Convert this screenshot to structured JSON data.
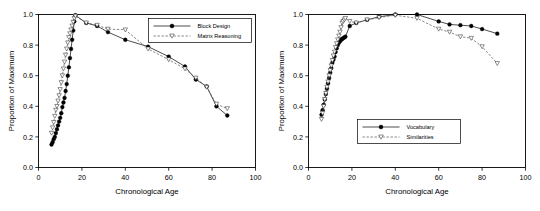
{
  "figure": {
    "background": "#ffffff",
    "line_color": "#000000",
    "dash_color": "#555555"
  },
  "chart_data": [
    {
      "type": "scatter",
      "panel": "left",
      "title": "",
      "xlabel": "Chronological Age",
      "ylabel": "Proportion of Maximum",
      "xlim": [
        0,
        100
      ],
      "ylim": [
        0.0,
        1.0
      ],
      "xticks": [
        0,
        20,
        40,
        60,
        80,
        100
      ],
      "yticks": [
        0.0,
        0.2,
        0.4,
        0.6,
        0.8,
        1.0
      ],
      "xticklabels": [
        "0",
        "20",
        "40",
        "60",
        "80",
        "100"
      ],
      "yticklabels": [
        "0.0",
        "0.2",
        "0.4",
        "0.6",
        "0.8",
        "1.0"
      ],
      "grid": false,
      "legend_position": "upper right",
      "series": [
        {
          "name": "Block Design",
          "marker": "filled-circle",
          "linestyle": "solid",
          "color": "#000000",
          "x": [
            6.0,
            6.5,
            7.0,
            7.5,
            8.0,
            8.5,
            9.0,
            9.5,
            10.0,
            10.5,
            11.0,
            11.5,
            12.0,
            12.5,
            13.0,
            13.5,
            14.0,
            14.5,
            15.0,
            15.5,
            16.0,
            16.5,
            17.0,
            22.0,
            27.0,
            32.0,
            40.0,
            50.5,
            60.0,
            67.5,
            72.5,
            77.5,
            82.0,
            87.0
          ],
          "y": [
            0.15,
            0.165,
            0.185,
            0.2,
            0.225,
            0.25,
            0.275,
            0.3,
            0.325,
            0.355,
            0.395,
            0.425,
            0.455,
            0.5,
            0.545,
            0.6,
            0.655,
            0.715,
            0.775,
            0.835,
            0.895,
            0.955,
            0.995,
            0.945,
            0.925,
            0.885,
            0.835,
            0.79,
            0.725,
            0.66,
            0.575,
            0.53,
            0.4,
            0.34
          ]
        },
        {
          "name": "Matrix Reasoning",
          "marker": "open-triangle-down",
          "linestyle": "dashed",
          "color": "#555555",
          "x": [
            6.0,
            6.5,
            7.0,
            7.5,
            8.0,
            8.5,
            9.0,
            9.5,
            10.0,
            10.5,
            11.0,
            11.5,
            12.0,
            12.5,
            13.0,
            13.5,
            14.0,
            14.5,
            15.0,
            15.5,
            16.0,
            16.5,
            17.0,
            22.0,
            27.0,
            32.0,
            40.0,
            50.5,
            60.0,
            67.5,
            72.5,
            77.5,
            82.0,
            87.0
          ],
          "y": [
            0.225,
            0.26,
            0.295,
            0.335,
            0.375,
            0.4,
            0.435,
            0.47,
            0.51,
            0.555,
            0.6,
            0.645,
            0.69,
            0.735,
            0.775,
            0.815,
            0.85,
            0.875,
            0.9,
            0.925,
            0.95,
            0.975,
            0.99,
            0.945,
            0.93,
            0.905,
            0.9,
            0.775,
            0.705,
            0.645,
            0.585,
            0.525,
            0.415,
            0.385
          ]
        }
      ]
    },
    {
      "type": "scatter",
      "panel": "right",
      "title": "",
      "xlabel": "Chronological Age",
      "ylabel": "Proportion of Maximum",
      "xlim": [
        0,
        100
      ],
      "ylim": [
        0.0,
        1.0
      ],
      "xticks": [
        0,
        20,
        40,
        60,
        80,
        100
      ],
      "yticks": [
        0.0,
        0.2,
        0.4,
        0.6,
        0.8,
        1.0
      ],
      "xticklabels": [
        "0",
        "20",
        "40",
        "60",
        "80",
        "100"
      ],
      "yticklabels": [
        "0.0",
        "0.2",
        "0.4",
        "0.6",
        "0.8",
        "1.0"
      ],
      "grid": false,
      "legend_position": "lower center",
      "series": [
        {
          "name": "Vocabulary",
          "marker": "filled-circle",
          "linestyle": "solid",
          "color": "#000000",
          "x": [
            6.0,
            6.5,
            7.0,
            7.5,
            8.0,
            8.5,
            9.0,
            9.5,
            10.0,
            10.5,
            11.0,
            11.5,
            12.0,
            12.5,
            13.0,
            13.5,
            14.0,
            14.5,
            15.0,
            15.5,
            16.0,
            16.5,
            17.0,
            19.0,
            22.0,
            27.0,
            32.5,
            40.0,
            50.0,
            60.0,
            65.0,
            70.0,
            75.0,
            80.0,
            87.0
          ],
          "y": [
            0.345,
            0.375,
            0.41,
            0.445,
            0.48,
            0.515,
            0.55,
            0.585,
            0.62,
            0.65,
            0.685,
            0.705,
            0.725,
            0.755,
            0.78,
            0.8,
            0.815,
            0.825,
            0.835,
            0.84,
            0.845,
            0.85,
            0.855,
            0.925,
            0.945,
            0.965,
            0.985,
            1.0,
            1.0,
            0.955,
            0.935,
            0.93,
            0.925,
            0.905,
            0.875
          ]
        },
        {
          "name": "Similarities",
          "marker": "open-triangle-down",
          "linestyle": "dashed",
          "color": "#555555",
          "x": [
            6.0,
            6.5,
            7.0,
            7.5,
            8.0,
            8.5,
            9.0,
            9.5,
            10.0,
            10.5,
            11.0,
            11.5,
            12.0,
            12.5,
            13.0,
            13.5,
            14.0,
            14.5,
            15.0,
            15.5,
            16.0,
            16.5,
            17.0,
            19.0,
            22.0,
            27.0,
            32.5,
            40.0,
            50.0,
            60.0,
            65.0,
            70.0,
            75.0,
            80.0,
            87.0
          ],
          "y": [
            0.315,
            0.355,
            0.4,
            0.445,
            0.485,
            0.525,
            0.56,
            0.6,
            0.635,
            0.665,
            0.7,
            0.73,
            0.755,
            0.785,
            0.81,
            0.835,
            0.86,
            0.885,
            0.915,
            0.945,
            0.955,
            0.965,
            0.975,
            0.955,
            0.945,
            0.965,
            0.98,
            0.995,
            0.975,
            0.905,
            0.885,
            0.855,
            0.845,
            0.79,
            0.68
          ]
        }
      ]
    }
  ]
}
